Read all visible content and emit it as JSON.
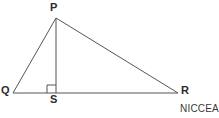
{
  "figure": {
    "type": "geometry-diagram",
    "background_color": "#ffffff",
    "stroke_color": "#555555",
    "label_color": "#2b2b2b",
    "labels": {
      "apex": "P",
      "base_left": "Q",
      "base_right": "R",
      "foot": "S"
    },
    "points": {
      "P": {
        "x": 56,
        "y": 18
      },
      "Q": {
        "x": 13,
        "y": 93
      },
      "R": {
        "x": 178,
        "y": 93
      },
      "S": {
        "x": 56,
        "y": 93
      }
    },
    "segments": [
      {
        "name": "PQ",
        "from": "P",
        "to": "Q"
      },
      {
        "name": "PR",
        "from": "P",
        "to": "R"
      },
      {
        "name": "QR",
        "from": "Q",
        "to": "R"
      },
      {
        "name": "PS",
        "from": "P",
        "to": "S"
      }
    ],
    "right_angle_marker": {
      "at": "S",
      "x": 47,
      "y": 85,
      "size": 8
    }
  },
  "attribution": {
    "text": "NICCEA"
  }
}
